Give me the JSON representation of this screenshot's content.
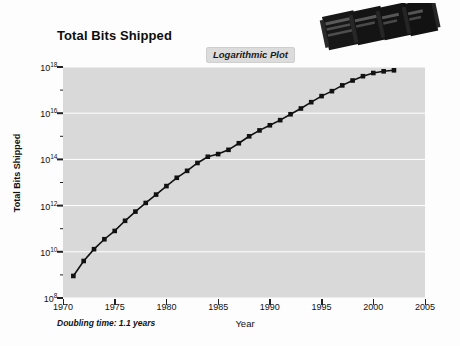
{
  "chart_data": {
    "type": "line",
    "title": "Total Bits Shipped",
    "xlabel": "Year",
    "ylabel": "Total Bits Shipped",
    "annotation": "Logarithmic Plot",
    "footnote": "Doubling time: 1.1 years",
    "grid": true,
    "legend": "none",
    "yscale": "log",
    "xlim": [
      1970,
      2005
    ],
    "ylim": [
      100000000.0,
      1e+18
    ],
    "xticks": [
      "1970",
      "1975",
      "1980",
      "1985",
      "1990",
      "1995",
      "2000",
      "2005"
    ],
    "xtick_values": [
      1970,
      1975,
      1980,
      1985,
      1990,
      1995,
      2000,
      2005
    ],
    "yticks": [
      "10^8",
      "10^10",
      "10^12",
      "10^14",
      "10^16",
      "10^18"
    ],
    "ytick_exponents": [
      8,
      10,
      12,
      14,
      16,
      18
    ],
    "ytick_mantissa": "10",
    "series": [
      {
        "name": "Total Bits Shipped",
        "marker": "square",
        "color": "#111111",
        "x": [
          1971,
          1972,
          1973,
          1974,
          1975,
          1976,
          1977,
          1978,
          1979,
          1980,
          1981,
          1982,
          1983,
          1984,
          1985,
          1986,
          1987,
          1988,
          1989,
          1990,
          1991,
          1992,
          1993,
          1994,
          1995,
          1996,
          1997,
          1998,
          1999,
          2000,
          2001,
          2002
        ],
        "y": [
          900000000.0,
          4000000000.0,
          13000000000.0,
          35000000000.0,
          80000000000.0,
          220000000000.0,
          550000000000.0,
          1300000000000.0,
          3000000000000.0,
          7000000000000.0,
          16000000000000.0,
          32000000000000.0,
          70000000000000.0,
          130000000000000.0,
          170000000000000.0,
          260000000000000.0,
          500000000000000.0,
          1000000000000000.0,
          1800000000000000.0,
          3000000000000000.0,
          5000000000000000.0,
          9000000000000000.0,
          1.6e+16,
          3e+16,
          5.5e+16,
          9e+16,
          1.6e+17,
          2.6e+17,
          4e+17,
          5.5e+17,
          6.5e+17,
          7.2e+17
        ]
      }
    ]
  },
  "photo": {
    "name": "memory-chip-photo",
    "description": "four dark memory chip packages"
  },
  "colors": {
    "plot_background": "#d9d9d9",
    "grid": "#ffffff",
    "line": "#111111",
    "page_background": "#fdfdfd",
    "badge_background": "#dcdcdc"
  }
}
